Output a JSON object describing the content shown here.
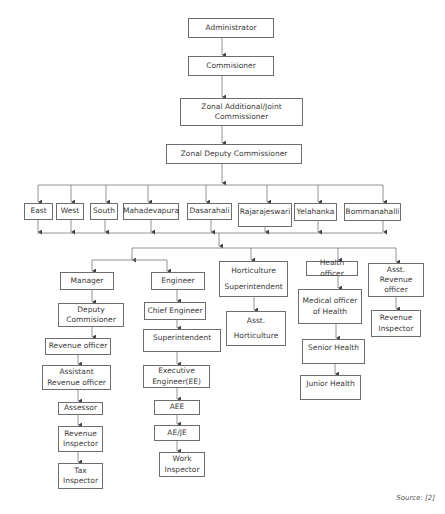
{
  "diagram": {
    "type": "org-chart",
    "hierarchy": [
      {
        "id": "administrator",
        "label": "Administrator"
      },
      {
        "id": "commisioner",
        "label": "Commisioner"
      },
      {
        "id": "zonal_joint",
        "label": "Zonal Additional/Joint Commissioner"
      },
      {
        "id": "zonal_deputy",
        "label": "Zonal Deputy Commissioner"
      }
    ],
    "zones": [
      "East",
      "West",
      "South",
      "Mahadevapura",
      "Dasarahali",
      "Rajarajeswari",
      "Yelahanka",
      "Bommanahalli"
    ],
    "branches": [
      {
        "head": "Manager",
        "chain": [
          "Deputy Commisioner",
          "Revenue officer",
          "Assistant Revenue officer",
          "Assessor",
          "Revenue Inspector",
          "Tax Inspector"
        ]
      },
      {
        "head": "Engineer",
        "chain": [
          "Chief Engineer",
          "Superintendent",
          "Executive Engineer(EE)",
          "AEE",
          "AE/JE",
          "Work Inspector"
        ]
      },
      {
        "head": "Horticulture Superintendent",
        "head_lines": [
          "Horticulture",
          "Superintendent"
        ],
        "chain": [
          "Asst. Horticulture"
        ],
        "chain_lines": [
          [
            "Asst.",
            "Horticulture"
          ]
        ]
      },
      {
        "head": "Health officer",
        "chain": [
          "Medical officer of Health",
          "Senior Health",
          "Junior Health"
        ]
      },
      {
        "head": "Asst. Revenue officer",
        "chain": [
          "Revenue Inspector"
        ]
      }
    ],
    "source": "Source: [2]"
  }
}
